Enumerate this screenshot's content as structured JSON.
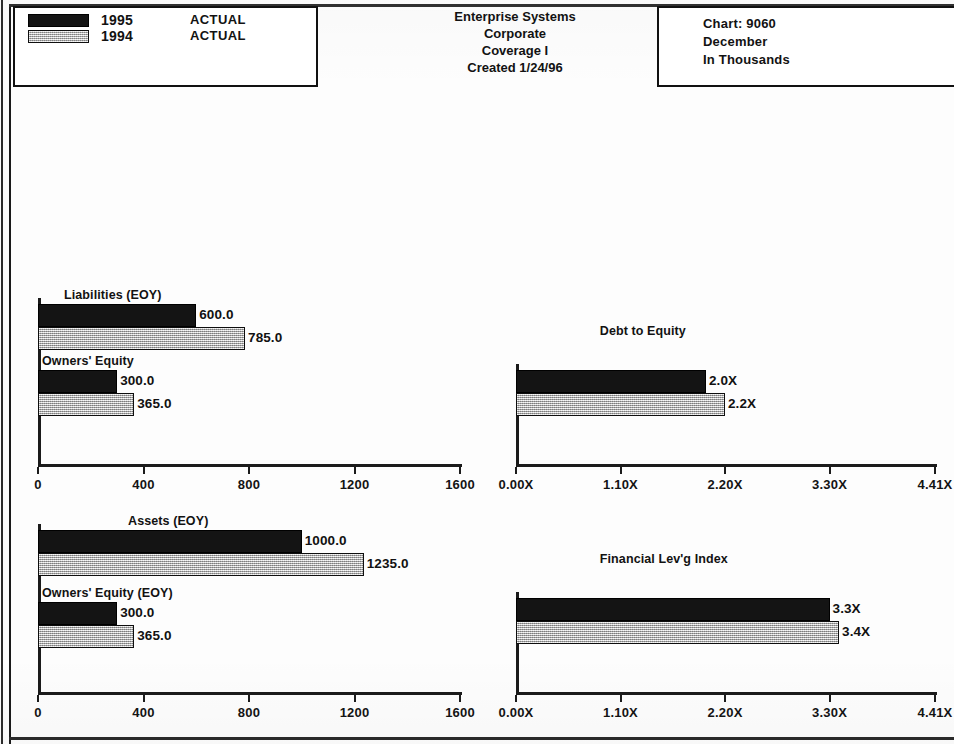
{
  "legend": {
    "entries": [
      {
        "year": "1995",
        "status": "ACTUAL",
        "swatch": "black"
      },
      {
        "year": "1994",
        "status": "ACTUAL",
        "swatch": "gray"
      }
    ]
  },
  "title_block": {
    "line1": "Enterprise Systems",
    "line2": "Corporate",
    "line3": "Coverage I",
    "line4": "Created 1/24/96"
  },
  "chart_info": {
    "chart_number": "Chart:  9060",
    "period": "December",
    "units": "In Thousands"
  },
  "chart_data": [
    {
      "id": "liabilities-equity",
      "position": "top-left",
      "type": "bar",
      "orientation": "horizontal",
      "title": "",
      "xlabel": "",
      "ylabel": "",
      "xlim": [
        0,
        1600
      ],
      "xticks": [
        0,
        400,
        800,
        1200,
        1600
      ],
      "xtick_labels": [
        "0",
        "400",
        "800",
        "1200",
        "1600"
      ],
      "grid": false,
      "categories": [
        "Liabilities (EOY)",
        "Owners' Equity"
      ],
      "series": [
        {
          "name": "1995",
          "swatch": "black",
          "values": [
            600.0,
            300.0
          ],
          "labels": [
            "600.0",
            "300.0"
          ]
        },
        {
          "name": "1994",
          "swatch": "gray",
          "values": [
            785.0,
            365.0
          ],
          "labels": [
            "785.0",
            "365.0"
          ]
        }
      ]
    },
    {
      "id": "debt-to-equity",
      "position": "top-right",
      "type": "bar",
      "orientation": "horizontal",
      "title": "Debt to Equity",
      "xlabel": "",
      "ylabel": "",
      "xlim": [
        0,
        4.41
      ],
      "xticks": [
        0,
        1.1,
        2.2,
        3.3,
        4.41
      ],
      "xtick_labels": [
        "0.00X",
        "1.10X",
        "2.20X",
        "3.30X",
        "4.41X"
      ],
      "grid": false,
      "categories": [
        "Debt to Equity"
      ],
      "series": [
        {
          "name": "1995",
          "swatch": "black",
          "values": [
            2.0
          ],
          "labels": [
            "2.0X"
          ]
        },
        {
          "name": "1994",
          "swatch": "gray",
          "values": [
            2.2
          ],
          "labels": [
            "2.2X"
          ]
        }
      ]
    },
    {
      "id": "assets-equity",
      "position": "bottom-left",
      "type": "bar",
      "orientation": "horizontal",
      "title": "",
      "xlabel": "",
      "ylabel": "",
      "xlim": [
        0,
        1600
      ],
      "xticks": [
        0,
        400,
        800,
        1200,
        1600
      ],
      "xtick_labels": [
        "0",
        "400",
        "800",
        "1200",
        "1600"
      ],
      "grid": false,
      "categories": [
        "Assets (EOY)",
        "Owners' Equity (EOY)"
      ],
      "series": [
        {
          "name": "1995",
          "swatch": "black",
          "values": [
            1000.0,
            300.0
          ],
          "labels": [
            "1000.0",
            "300.0"
          ]
        },
        {
          "name": "1994",
          "swatch": "gray",
          "values": [
            1235.0,
            365.0
          ],
          "labels": [
            "1235.0",
            "365.0"
          ]
        }
      ]
    },
    {
      "id": "financial-leverage-index",
      "position": "bottom-right",
      "type": "bar",
      "orientation": "horizontal",
      "title": "Financial Lev'g Index",
      "xlabel": "",
      "ylabel": "",
      "xlim": [
        0,
        4.41
      ],
      "xticks": [
        0,
        1.1,
        2.2,
        3.3,
        4.41
      ],
      "xtick_labels": [
        "0.00X",
        "1.10X",
        "2.20X",
        "3.30X",
        "4.41X"
      ],
      "grid": false,
      "categories": [
        "Financial Lev'g Index"
      ],
      "series": [
        {
          "name": "1995",
          "swatch": "black",
          "values": [
            3.3
          ],
          "labels": [
            "3.3X"
          ]
        },
        {
          "name": "1994",
          "swatch": "gray",
          "values": [
            3.4
          ],
          "labels": [
            "3.4X"
          ]
        }
      ]
    }
  ],
  "colors": {
    "series_1995": "#141414",
    "series_1994": "#c6c6c6",
    "ink": "#1b1b1b",
    "paper": "#ffffff"
  }
}
